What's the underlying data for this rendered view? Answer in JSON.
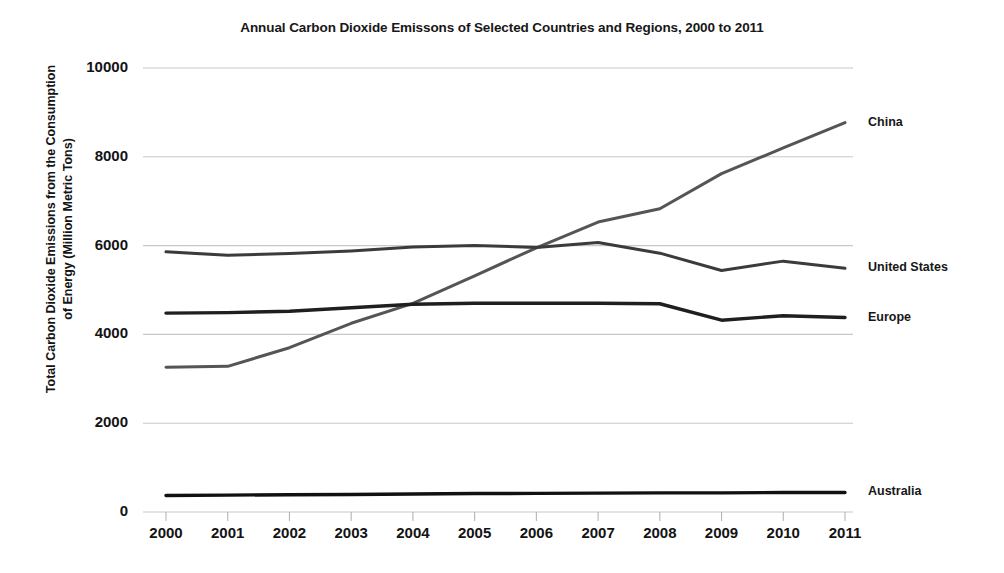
{
  "chart_data": {
    "type": "line",
    "title": "Annual Carbon Dioxide Emissons of Selected Countries and Regions, 2000 to 2011",
    "xlabel": "",
    "ylabel": "Total Carbon Dioxide Emissions from the Consumption\nof Energy (Million Metric Tons)",
    "x": [
      2000,
      2001,
      2002,
      2003,
      2004,
      2005,
      2006,
      2007,
      2008,
      2009,
      2010,
      2011
    ],
    "categories": [
      "2000",
      "2001",
      "2002",
      "2003",
      "2004",
      "2005",
      "2006",
      "2007",
      "2008",
      "2009",
      "2010",
      "2011"
    ],
    "yticks": [
      0,
      2000,
      4000,
      6000,
      8000,
      10000
    ],
    "yticklabels": [
      "0",
      "2000",
      "4000",
      "6000",
      "8000",
      "10000"
    ],
    "ylim": [
      0,
      10400
    ],
    "xlim": [
      2000,
      2011
    ],
    "grid": true,
    "grid_color": "#c8c8c8",
    "legend_position": "right-of-line-ends",
    "series": [
      {
        "name": "China",
        "color": "#555555",
        "values": [
          3260,
          3280,
          3700,
          4250,
          4700,
          5320,
          5950,
          6530,
          6830,
          7620,
          8200,
          8770
        ]
      },
      {
        "name": "United States",
        "color": "#3b3b3b",
        "values": [
          5860,
          5780,
          5820,
          5880,
          5970,
          6000,
          5960,
          6070,
          5830,
          5440,
          5650,
          5490
        ]
      },
      {
        "name": "Europe",
        "color": "#1f1f1f",
        "values": [
          4480,
          4490,
          4520,
          4600,
          4680,
          4700,
          4700,
          4700,
          4690,
          4320,
          4420,
          4380
        ]
      },
      {
        "name": "Australia",
        "color": "#111111",
        "values": [
          370,
          380,
          390,
          395,
          405,
          415,
          420,
          425,
          430,
          430,
          440,
          440
        ]
      }
    ]
  }
}
